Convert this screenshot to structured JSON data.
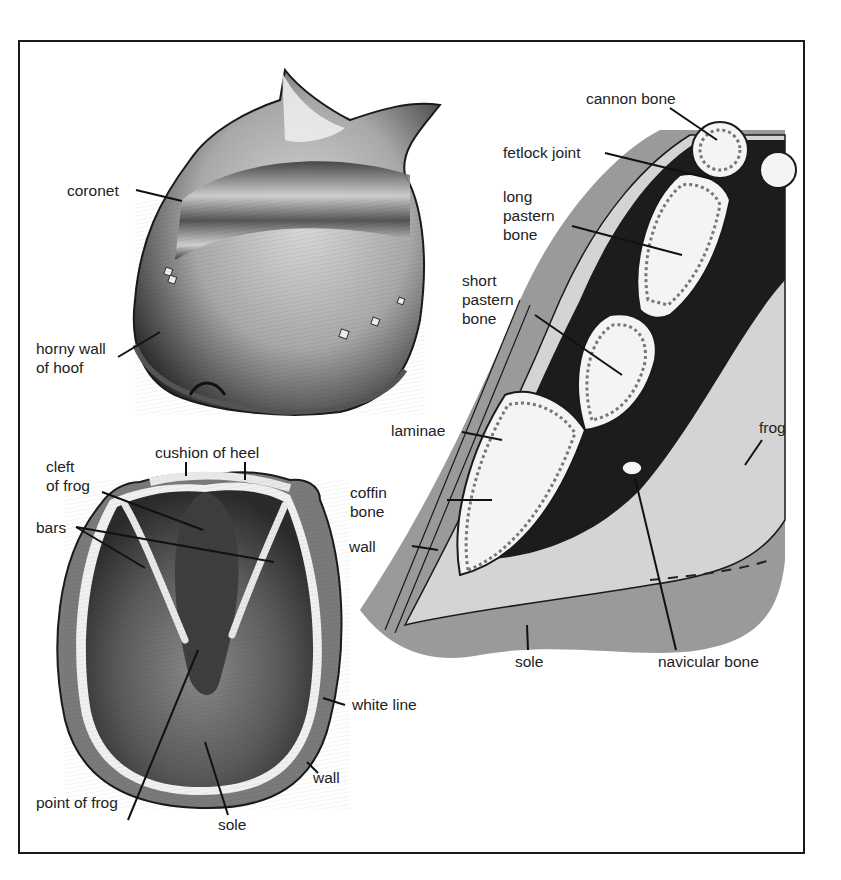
{
  "figure": {
    "panels": [
      {
        "name": "side-view-of-hoof",
        "labels": [
          "coronet",
          "horny wall\nof hoof"
        ]
      },
      {
        "name": "underside-of-hoof",
        "labels": [
          "cushion of heel",
          "cleft\nof frog",
          "bars",
          "white line",
          "wall",
          "point of frog",
          "sole"
        ]
      },
      {
        "name": "cross-section-of-foot",
        "labels": [
          "cannon bone",
          "fetlock joint",
          "long\npastern\nbone",
          "short\npastern\nbone",
          "laminae",
          "coffin\nbone",
          "wall",
          "frog",
          "sole",
          "navicular bone"
        ]
      }
    ]
  },
  "labels": {
    "coronet": "coronet",
    "horny_wall": "horny wall\nof hoof",
    "cushion_of_heel": "cushion of heel",
    "cleft_of_frog": "cleft\nof frog",
    "bars": "bars",
    "white_line": "white line",
    "wall_bottom": "wall",
    "point_of_frog": "point of frog",
    "sole_bottom": "sole",
    "cannon_bone": "cannon bone",
    "fetlock_joint": "fetlock joint",
    "long_pastern_bone": "long\npastern\nbone",
    "short_pastern_bone": "short\npastern\nbone",
    "laminae": "laminae",
    "coffin_bone": "coffin\nbone",
    "wall_section": "wall",
    "frog": "frog",
    "sole_section": "sole",
    "navicular_bone": "navicular bone"
  },
  "colors": {
    "outline": "#1a1a1a",
    "dark_tissue": "#1c1c1c",
    "mid_grey": "#9a9a9a",
    "light_grey": "#d4d4d4",
    "bone_fill": "#f4f4f4",
    "background": "#ffffff"
  }
}
